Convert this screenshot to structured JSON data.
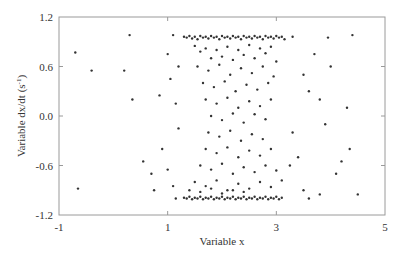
{
  "chart_data": {
    "type": "scatter",
    "title": "",
    "xlabel": "Variable x",
    "ylabel": "Variable dx/dt (s",
    "ylabel_superscript": "-1",
    "ylabel_suffix": ")",
    "xlim": [
      -1,
      5
    ],
    "ylim": [
      -1.2,
      1.2
    ],
    "xticks": [
      -1,
      1,
      3,
      5
    ],
    "xtick_labels": [
      "-1",
      "1",
      "3",
      "5"
    ],
    "yticks": [
      1.2,
      0.6,
      0.0,
      -0.6,
      -1.2
    ],
    "ytick_labels": [
      "1.2",
      "0.6",
      "0.0",
      "-0.6",
      "-1.2"
    ],
    "grid": false,
    "legend": null,
    "marker": {
      "color": "#333333",
      "size": 1.2
    },
    "frame_color": "#9a9a9a",
    "series": [
      {
        "name": "points",
        "points": [
          [
            -0.7,
            0.77
          ],
          [
            0.3,
            0.98
          ],
          [
            0.2,
            0.55
          ],
          [
            -0.4,
            0.55
          ],
          [
            0.35,
            0.2
          ],
          [
            -0.65,
            -0.88
          ],
          [
            0.75,
            -0.9
          ],
          [
            0.7,
            -0.7
          ],
          [
            0.9,
            -0.4
          ],
          [
            0.55,
            -0.55
          ],
          [
            0.85,
            0.25
          ],
          [
            1.0,
            0.75
          ],
          [
            1.05,
            0.45
          ],
          [
            1.1,
            0.98
          ],
          [
            1.15,
            0.15
          ],
          [
            1.2,
            -0.15
          ],
          [
            1.0,
            -0.65
          ],
          [
            1.1,
            -0.85
          ],
          [
            1.15,
            -1.0
          ],
          [
            1.2,
            0.6
          ],
          [
            1.3,
            0.96
          ],
          [
            1.35,
            0.95
          ],
          [
            1.4,
            0.97
          ],
          [
            1.45,
            0.94
          ],
          [
            1.5,
            0.96
          ],
          [
            1.55,
            0.93
          ],
          [
            1.6,
            0.97
          ],
          [
            1.65,
            0.95
          ],
          [
            1.7,
            0.96
          ],
          [
            1.75,
            0.94
          ],
          [
            1.8,
            0.97
          ],
          [
            1.85,
            0.95
          ],
          [
            1.9,
            0.96
          ],
          [
            1.95,
            0.93
          ],
          [
            2.0,
            0.97
          ],
          [
            2.05,
            0.95
          ],
          [
            2.1,
            0.96
          ],
          [
            2.15,
            0.94
          ],
          [
            2.2,
            0.97
          ],
          [
            2.25,
            0.95
          ],
          [
            2.3,
            0.96
          ],
          [
            2.35,
            0.93
          ],
          [
            2.4,
            0.97
          ],
          [
            2.45,
            0.95
          ],
          [
            2.5,
            0.96
          ],
          [
            2.55,
            0.94
          ],
          [
            2.6,
            0.97
          ],
          [
            2.65,
            0.95
          ],
          [
            2.7,
            0.96
          ],
          [
            2.75,
            0.93
          ],
          [
            2.8,
            0.97
          ],
          [
            2.85,
            0.95
          ],
          [
            2.9,
            0.96
          ],
          [
            2.95,
            0.94
          ],
          [
            3.0,
            0.97
          ],
          [
            3.05,
            0.95
          ],
          [
            3.1,
            0.96
          ],
          [
            3.15,
            0.93
          ],
          [
            1.3,
            -0.99
          ],
          [
            1.35,
            -1.0
          ],
          [
            1.4,
            -0.98
          ],
          [
            1.45,
            -1.01
          ],
          [
            1.5,
            -0.99
          ],
          [
            1.55,
            -1.0
          ],
          [
            1.6,
            -0.98
          ],
          [
            1.65,
            -1.01
          ],
          [
            1.7,
            -0.99
          ],
          [
            1.75,
            -1.0
          ],
          [
            1.8,
            -0.98
          ],
          [
            1.85,
            -1.01
          ],
          [
            1.9,
            -0.99
          ],
          [
            1.95,
            -1.0
          ],
          [
            2.0,
            -0.98
          ],
          [
            2.05,
            -1.01
          ],
          [
            2.1,
            -0.99
          ],
          [
            2.15,
            -1.0
          ],
          [
            2.2,
            -0.98
          ],
          [
            2.25,
            -1.01
          ],
          [
            2.3,
            -0.99
          ],
          [
            2.35,
            -1.0
          ],
          [
            2.4,
            -0.98
          ],
          [
            2.45,
            -1.01
          ],
          [
            2.5,
            -0.99
          ],
          [
            2.55,
            -1.0
          ],
          [
            2.6,
            -0.98
          ],
          [
            2.65,
            -1.01
          ],
          [
            2.7,
            -0.99
          ],
          [
            2.75,
            -1.0
          ],
          [
            2.8,
            -0.98
          ],
          [
            2.85,
            -1.01
          ],
          [
            2.9,
            -0.99
          ],
          [
            2.95,
            -1.0
          ],
          [
            3.0,
            -0.98
          ],
          [
            3.05,
            -1.01
          ],
          [
            3.1,
            -0.99
          ],
          [
            1.5,
            0.85
          ],
          [
            1.6,
            0.78
          ],
          [
            1.7,
            0.82
          ],
          [
            1.8,
            0.7
          ],
          [
            1.9,
            0.8
          ],
          [
            2.0,
            0.72
          ],
          [
            2.1,
            0.84
          ],
          [
            2.2,
            0.68
          ],
          [
            2.3,
            0.8
          ],
          [
            2.4,
            0.74
          ],
          [
            2.5,
            0.86
          ],
          [
            2.6,
            0.7
          ],
          [
            2.7,
            0.82
          ],
          [
            2.8,
            0.76
          ],
          [
            2.9,
            0.84
          ],
          [
            3.0,
            0.66
          ],
          [
            1.55,
            0.6
          ],
          [
            1.75,
            0.55
          ],
          [
            1.95,
            0.62
          ],
          [
            2.15,
            0.5
          ],
          [
            2.35,
            0.58
          ],
          [
            2.55,
            0.52
          ],
          [
            2.75,
            0.6
          ],
          [
            2.95,
            0.48
          ],
          [
            1.65,
            0.4
          ],
          [
            1.85,
            0.35
          ],
          [
            2.05,
            0.42
          ],
          [
            2.25,
            0.3
          ],
          [
            2.45,
            0.38
          ],
          [
            2.65,
            0.32
          ],
          [
            2.85,
            0.4
          ],
          [
            1.7,
            0.2
          ],
          [
            1.9,
            0.15
          ],
          [
            2.1,
            0.22
          ],
          [
            2.3,
            0.1
          ],
          [
            2.5,
            0.18
          ],
          [
            2.7,
            0.12
          ],
          [
            2.9,
            0.2
          ],
          [
            1.8,
            0.0
          ],
          [
            2.0,
            -0.05
          ],
          [
            2.2,
            0.03
          ],
          [
            2.4,
            -0.08
          ],
          [
            2.6,
            0.02
          ],
          [
            2.8,
            -0.04
          ],
          [
            1.75,
            -0.2
          ],
          [
            1.95,
            -0.25
          ],
          [
            2.15,
            -0.18
          ],
          [
            2.35,
            -0.3
          ],
          [
            2.55,
            -0.22
          ],
          [
            2.75,
            -0.28
          ],
          [
            1.7,
            -0.4
          ],
          [
            1.9,
            -0.45
          ],
          [
            2.1,
            -0.38
          ],
          [
            2.3,
            -0.5
          ],
          [
            2.5,
            -0.42
          ],
          [
            2.7,
            -0.48
          ],
          [
            2.9,
            -0.4
          ],
          [
            1.6,
            -0.6
          ],
          [
            1.8,
            -0.65
          ],
          [
            2.0,
            -0.58
          ],
          [
            2.2,
            -0.7
          ],
          [
            2.4,
            -0.62
          ],
          [
            2.6,
            -0.68
          ],
          [
            2.8,
            -0.6
          ],
          [
            3.0,
            -0.66
          ],
          [
            1.5,
            -0.8
          ],
          [
            1.7,
            -0.85
          ],
          [
            1.9,
            -0.78
          ],
          [
            2.1,
            -0.9
          ],
          [
            2.3,
            -0.82
          ],
          [
            2.5,
            -0.88
          ],
          [
            2.7,
            -0.8
          ],
          [
            2.9,
            -0.86
          ],
          [
            3.1,
            -0.78
          ],
          [
            1.4,
            -0.9
          ],
          [
            1.6,
            -0.92
          ],
          [
            1.8,
            -0.88
          ],
          [
            2.0,
            -0.94
          ],
          [
            2.2,
            -0.9
          ],
          [
            2.4,
            -0.92
          ],
          [
            3.3,
            0.96
          ],
          [
            3.5,
            0.5
          ],
          [
            3.6,
            0.3
          ],
          [
            3.3,
            -0.2
          ],
          [
            3.4,
            -0.5
          ],
          [
            3.7,
            0.75
          ],
          [
            3.8,
            0.2
          ],
          [
            3.9,
            -0.1
          ],
          [
            3.5,
            -0.9
          ],
          [
            3.6,
            -1.0
          ],
          [
            3.8,
            -0.95
          ],
          [
            4.0,
            0.6
          ],
          [
            4.2,
            -0.55
          ],
          [
            4.35,
            -0.4
          ],
          [
            4.4,
            0.98
          ],
          [
            4.5,
            -0.95
          ],
          [
            4.3,
            0.1
          ],
          [
            3.95,
            0.95
          ],
          [
            4.1,
            -0.7
          ],
          [
            3.25,
            -0.6
          ]
        ]
      }
    ]
  }
}
